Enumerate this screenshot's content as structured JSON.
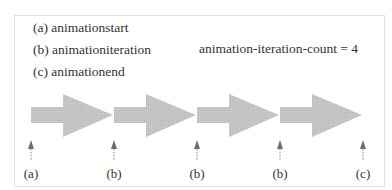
{
  "legend": {
    "items": [
      {
        "key": "(a)",
        "text": "(a) animationstart"
      },
      {
        "key": "(b)",
        "text": "(b) animationiteration"
      },
      {
        "key": "(c)",
        "text": "(c) animationend"
      }
    ]
  },
  "annotation": {
    "text": "animation-iteration-count = 4"
  },
  "iterations": 4,
  "markers": [
    {
      "label": "(a)",
      "x": 31
    },
    {
      "label": "(b)",
      "x": 114
    },
    {
      "label": "(b)",
      "x": 197
    },
    {
      "label": "(b)",
      "x": 280
    },
    {
      "label": "(c)",
      "x": 363
    }
  ],
  "colors": {
    "arrow_fill": "#c4c4c4",
    "marker": "#7a7a7a",
    "border": "#e2e2e2",
    "text": "#333333"
  }
}
